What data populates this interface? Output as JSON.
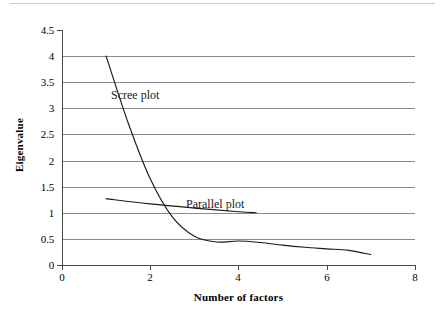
{
  "chart_data": {
    "type": "line",
    "title": "",
    "xlabel": "Number of factors",
    "ylabel": "Eigenvalue",
    "xlim": [
      0,
      8
    ],
    "ylim": [
      0,
      4.5
    ],
    "xticks": [
      "0",
      "2",
      "4",
      "6",
      "8"
    ],
    "xtick_values": [
      0,
      2,
      4,
      6,
      8
    ],
    "yticks": [
      "0",
      "0.5",
      "1",
      "1.5",
      "2",
      "2.5",
      "3",
      "3.5",
      "4",
      "4.5"
    ],
    "ytick_values": [
      0,
      0.5,
      1,
      1.5,
      2,
      2.5,
      3,
      3.5,
      4,
      4.5
    ],
    "grid": "horizontal",
    "gridline_values": [
      0.5,
      1,
      1.5,
      2,
      2.5,
      3,
      3.5,
      4
    ],
    "legend": "inline-annotations",
    "series": [
      {
        "name": "Scree plot",
        "x": [
          1,
          1.5,
          2,
          2.5,
          3,
          3.5,
          4,
          4.5,
          5,
          5.5,
          6,
          6.5,
          7
        ],
        "values": [
          4.0,
          2.72,
          1.65,
          0.92,
          0.55,
          0.44,
          0.46,
          0.43,
          0.38,
          0.34,
          0.31,
          0.28,
          0.2
        ]
      },
      {
        "name": "Parallel plot",
        "x": [
          1,
          2,
          3,
          4,
          4.4
        ],
        "values": [
          1.27,
          1.17,
          1.09,
          1.02,
          1.0
        ]
      }
    ],
    "annotations": [
      {
        "text": "Scree plot",
        "x": 1.1,
        "y": 3.35
      },
      {
        "text": "Parallel plot",
        "x": 2.8,
        "y": 1.27
      }
    ],
    "colors": {
      "series_line": "#1a1a1a",
      "gridline": "#8a8a8a",
      "axis": "#4a4a4a",
      "background": "#ffffff",
      "text": "#000000"
    }
  }
}
